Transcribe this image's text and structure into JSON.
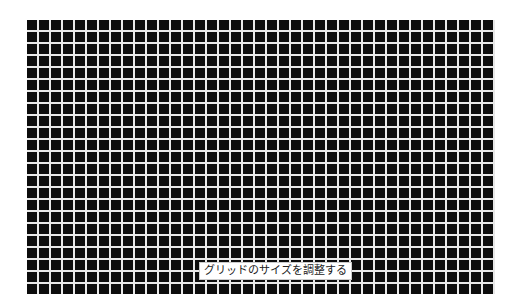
{
  "grid": {
    "cell_size_px": 12,
    "line_color": "#e8e8e8",
    "background_color": "#0c0c0c",
    "columns": 39,
    "rows": 23
  },
  "label": {
    "text": "グリッドのサイズを調整する"
  }
}
